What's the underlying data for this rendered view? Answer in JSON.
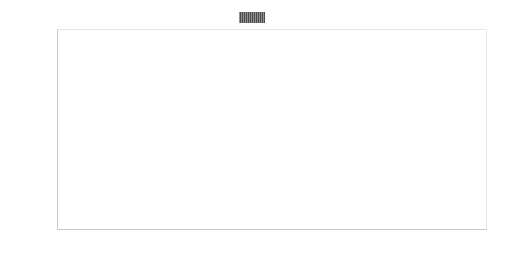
{
  "chart_data": {
    "type": "bar",
    "orientation": "horizontal",
    "title": "",
    "xlabel": "",
    "ylabel": "",
    "xlim": [
      0,
      60
    ],
    "xtick_labels": [
      "0%",
      "5%",
      "10%",
      "15%",
      "20%",
      "25%",
      "30%",
      "35%",
      "40%",
      "45%",
      "50%",
      "55%",
      "60%"
    ],
    "xtick_values": [
      0,
      5,
      10,
      15,
      20,
      25,
      30,
      35,
      40,
      45,
      50,
      55,
      60
    ],
    "grid": true,
    "legend_position": "top-center",
    "series": [
      {
        "name": "变异频度",
        "color": "#4a4a4a",
        "values": [
          56.0,
          30.5,
          25.8,
          20.9,
          18.2,
          16.1,
          16.0,
          15.7,
          15.4,
          15.2
        ]
      }
    ],
    "categories": [
      "TP53",
      "CDKN2A",
      "KRAS",
      "ARID1A",
      "CDKN2B",
      "SMAD4",
      "ATM",
      "KMT2D",
      "BRCA2",
      "STK11"
    ]
  },
  "legend": {
    "label": "变异频度",
    "swatch_name": "hatched-dark-gray-swatch",
    "swatch_color": "#4a4a4a"
  },
  "axes": {
    "y_categories": [
      "TP53",
      "CDKN2A",
      "KRAS",
      "ARID1A",
      "CDKN2B",
      "SMAD4",
      "ATM",
      "KMT2D",
      "BRCA2",
      "STK11"
    ],
    "x_ticks": [
      "0%",
      "5%",
      "10%",
      "15%",
      "20%",
      "25%",
      "30%",
      "35%",
      "40%",
      "45%",
      "50%",
      "55%",
      "60%"
    ]
  },
  "style": {
    "bar_color": "#4a4a4a",
    "grid_color": "#e6e6e6",
    "axis_color": "#c9c9c9",
    "text_color": "#2b2b2b",
    "background": "#ffffff"
  }
}
